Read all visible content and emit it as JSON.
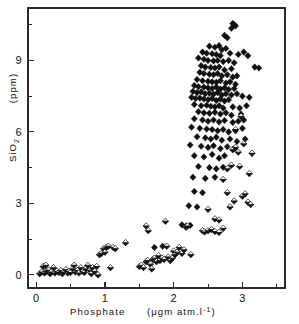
{
  "figure": {
    "background_color": "#ffffff",
    "ink_color": "#111111"
  },
  "chart_data": {
    "type": "scatter",
    "title": "",
    "subtitle": "",
    "xlabel": "Phosphate",
    "xunit": "(μgm atm.l",
    "xunit_sup": "-1",
    "xunit_close": ")",
    "ylabel": "SiO",
    "ylabel_sub": "2",
    "yunit": "(ppm)",
    "xlim": [
      -0.12,
      3.62
    ],
    "ylim": [
      -0.55,
      11.2
    ],
    "xticks": [
      0,
      1,
      2,
      3
    ],
    "xticklabels": [
      "0",
      "1",
      "2",
      "3"
    ],
    "xminorticks": [
      0.5,
      1.5,
      2.5,
      3.5
    ],
    "yticks": [
      0,
      3,
      6,
      9
    ],
    "yticklabels": [
      "0",
      "3",
      "6",
      "9"
    ],
    "yminorticks": [
      1.5,
      4.5,
      7.5,
      10.5
    ],
    "grid": false,
    "legend": null,
    "frame": "box",
    "series": [
      {
        "name": "solid-diamond",
        "marker": "filled-diamond",
        "color": "#101010",
        "points": [
          [
            2.86,
            10.55
          ],
          [
            2.88,
            10.5
          ],
          [
            2.9,
            10.45
          ],
          [
            2.84,
            10.35
          ],
          [
            2.74,
            10.05
          ],
          [
            2.78,
            9.95
          ],
          [
            2.52,
            9.6
          ],
          [
            2.6,
            9.55
          ],
          [
            2.66,
            9.62
          ],
          [
            2.7,
            9.45
          ],
          [
            2.76,
            9.5
          ],
          [
            2.42,
            9.35
          ],
          [
            2.48,
            9.3
          ],
          [
            2.56,
            9.28
          ],
          [
            2.62,
            9.25
          ],
          [
            2.68,
            9.2
          ],
          [
            2.82,
            9.3
          ],
          [
            2.94,
            9.25
          ],
          [
            3.02,
            9.35
          ],
          [
            3.08,
            9.2
          ],
          [
            2.36,
            9.1
          ],
          [
            2.44,
            9.05
          ],
          [
            2.5,
            9.0
          ],
          [
            2.58,
            8.98
          ],
          [
            2.64,
            9.0
          ],
          [
            2.72,
            8.95
          ],
          [
            2.8,
            9.0
          ],
          [
            2.88,
            8.9
          ],
          [
            2.4,
            8.78
          ],
          [
            2.46,
            8.72
          ],
          [
            2.54,
            8.7
          ],
          [
            2.6,
            8.68
          ],
          [
            2.66,
            8.72
          ],
          [
            2.74,
            8.6
          ],
          [
            2.84,
            8.65
          ],
          [
            3.18,
            8.72
          ],
          [
            3.24,
            8.68
          ],
          [
            2.38,
            8.5
          ],
          [
            2.44,
            8.45
          ],
          [
            2.52,
            8.42
          ],
          [
            2.58,
            8.4
          ],
          [
            2.64,
            8.45
          ],
          [
            2.7,
            8.35
          ],
          [
            2.78,
            8.4
          ],
          [
            2.86,
            8.3
          ],
          [
            2.92,
            8.35
          ],
          [
            2.34,
            8.2
          ],
          [
            2.42,
            8.15
          ],
          [
            2.5,
            8.12
          ],
          [
            2.56,
            8.1
          ],
          [
            2.62,
            8.08
          ],
          [
            2.68,
            8.15
          ],
          [
            2.76,
            8.05
          ],
          [
            2.82,
            8.1
          ],
          [
            2.9,
            8.0
          ],
          [
            2.3,
            7.95
          ],
          [
            2.36,
            7.9
          ],
          [
            2.44,
            7.88
          ],
          [
            2.5,
            7.85
          ],
          [
            2.56,
            7.82
          ],
          [
            2.62,
            7.88
          ],
          [
            2.68,
            7.8
          ],
          [
            2.74,
            7.85
          ],
          [
            2.8,
            7.78
          ],
          [
            2.88,
            7.82
          ],
          [
            2.28,
            7.7
          ],
          [
            2.34,
            7.65
          ],
          [
            2.4,
            7.68
          ],
          [
            2.46,
            7.6
          ],
          [
            2.52,
            7.62
          ],
          [
            2.58,
            7.58
          ],
          [
            2.64,
            7.65
          ],
          [
            2.7,
            7.55
          ],
          [
            2.76,
            7.6
          ],
          [
            2.84,
            7.55
          ],
          [
            2.92,
            7.6
          ],
          [
            3.0,
            7.5
          ],
          [
            3.1,
            7.45
          ],
          [
            2.26,
            7.45
          ],
          [
            2.32,
            7.4
          ],
          [
            2.38,
            7.42
          ],
          [
            2.44,
            7.38
          ],
          [
            2.5,
            7.35
          ],
          [
            2.56,
            7.4
          ],
          [
            2.62,
            7.32
          ],
          [
            2.68,
            7.38
          ],
          [
            2.74,
            7.3
          ],
          [
            2.8,
            7.35
          ],
          [
            2.3,
            7.15
          ],
          [
            2.4,
            7.1
          ],
          [
            2.48,
            7.12
          ],
          [
            2.54,
            7.08
          ],
          [
            2.6,
            7.05
          ],
          [
            2.66,
            7.1
          ],
          [
            2.72,
            7.0
          ],
          [
            2.86,
            7.05
          ],
          [
            2.96,
            7.0
          ],
          [
            3.06,
            7.1
          ],
          [
            2.36,
            6.85
          ],
          [
            2.44,
            6.8
          ],
          [
            2.52,
            6.78
          ],
          [
            2.6,
            6.82
          ],
          [
            2.68,
            6.75
          ],
          [
            2.76,
            6.8
          ],
          [
            2.84,
            6.7
          ],
          [
            2.98,
            6.75
          ],
          [
            2.3,
            6.55
          ],
          [
            2.42,
            6.5
          ],
          [
            2.5,
            6.45
          ],
          [
            2.58,
            6.5
          ],
          [
            2.66,
            6.42
          ],
          [
            2.74,
            6.48
          ],
          [
            2.86,
            6.4
          ],
          [
            2.94,
            6.45
          ],
          [
            3.02,
            6.5
          ],
          [
            2.26,
            6.2
          ],
          [
            2.38,
            6.15
          ],
          [
            2.48,
            6.12
          ],
          [
            2.56,
            6.1
          ],
          [
            2.64,
            6.05
          ],
          [
            2.72,
            6.1
          ],
          [
            2.8,
            6.0
          ],
          [
            2.9,
            6.05
          ],
          [
            3.0,
            6.15
          ],
          [
            2.34,
            5.8
          ],
          [
            2.46,
            5.75
          ],
          [
            2.54,
            5.7
          ],
          [
            2.62,
            5.78
          ],
          [
            2.7,
            5.65
          ],
          [
            2.82,
            5.7
          ],
          [
            2.92,
            5.6
          ],
          [
            3.04,
            5.7
          ],
          [
            2.24,
            5.45
          ],
          [
            2.4,
            5.4
          ],
          [
            2.5,
            5.35
          ],
          [
            2.58,
            5.42
          ],
          [
            2.68,
            5.3
          ],
          [
            2.78,
            5.38
          ],
          [
            2.88,
            5.3
          ],
          [
            2.3,
            5.0
          ],
          [
            2.44,
            4.95
          ],
          [
            2.56,
            5.05
          ],
          [
            2.66,
            4.9
          ],
          [
            2.74,
            5.0
          ],
          [
            2.36,
            4.55
          ],
          [
            2.52,
            4.5
          ],
          [
            2.62,
            4.45
          ],
          [
            2.72,
            4.52
          ],
          [
            2.28,
            4.1
          ],
          [
            2.46,
            4.05
          ],
          [
            2.6,
            4.1
          ],
          [
            2.3,
            3.5
          ],
          [
            2.42,
            3.45
          ],
          [
            2.22,
            2.9
          ],
          [
            2.34,
            2.85
          ],
          [
            2.12,
            2.1
          ],
          [
            2.18,
            2.05
          ],
          [
            2.24,
            2.08
          ],
          [
            1.72,
            1.15
          ],
          [
            1.84,
            1.2
          ]
        ]
      },
      {
        "name": "half-filled-diamond",
        "marker": "half-filled-diamond",
        "color": "#101010",
        "points": [
          [
            0.05,
            0.05
          ],
          [
            0.08,
            0.12
          ],
          [
            0.1,
            0.35
          ],
          [
            0.12,
            0.08
          ],
          [
            0.14,
            0.4
          ],
          [
            0.15,
            0.15
          ],
          [
            0.18,
            0.2
          ],
          [
            0.2,
            0.05
          ],
          [
            0.22,
            0.12
          ],
          [
            0.25,
            0.3
          ],
          [
            0.27,
            0.08
          ],
          [
            0.3,
            0.15
          ],
          [
            0.33,
            0.1
          ],
          [
            0.36,
            0.18
          ],
          [
            0.38,
            0.05
          ],
          [
            0.4,
            0.12
          ],
          [
            0.43,
            0.22
          ],
          [
            0.46,
            0.08
          ],
          [
            0.48,
            0.15
          ],
          [
            0.5,
            0.1
          ],
          [
            0.53,
            0.25
          ],
          [
            0.55,
            0.4
          ],
          [
            0.57,
            0.12
          ],
          [
            0.6,
            0.18
          ],
          [
            0.62,
            0.08
          ],
          [
            0.65,
            0.3
          ],
          [
            0.68,
            0.15
          ],
          [
            0.7,
            0.1
          ],
          [
            0.72,
            0.25
          ],
          [
            0.75,
            0.4
          ],
          [
            0.78,
            0.2
          ],
          [
            0.8,
            0.05
          ],
          [
            0.82,
            0.3
          ],
          [
            0.85,
            0.15
          ],
          [
            0.88,
            0.35
          ],
          [
            0.9,
            0.0
          ],
          [
            0.92,
            0.85
          ],
          [
            0.95,
            0.9
          ],
          [
            0.98,
            1.1
          ],
          [
            1.0,
            0.95
          ],
          [
            1.02,
            1.15
          ],
          [
            1.05,
            1.2
          ],
          [
            1.08,
            0.3
          ],
          [
            1.12,
            1.15
          ],
          [
            1.15,
            1.1
          ],
          [
            1.3,
            1.35
          ],
          [
            1.5,
            0.35
          ],
          [
            1.53,
            0.4
          ],
          [
            1.56,
            0.3
          ],
          [
            1.6,
            0.55
          ],
          [
            1.62,
            0.6
          ],
          [
            1.6,
            2.05
          ],
          [
            1.63,
            1.85
          ],
          [
            1.66,
            0.45
          ],
          [
            1.68,
            0.25
          ],
          [
            1.7,
            0.65
          ],
          [
            1.72,
            0.7
          ],
          [
            1.75,
            0.55
          ],
          [
            1.78,
            0.8
          ],
          [
            1.8,
            0.6
          ],
          [
            1.83,
            0.7
          ],
          [
            1.86,
            0.65
          ],
          [
            1.88,
            2.25
          ],
          [
            1.9,
            1.2
          ],
          [
            1.92,
            0.75
          ],
          [
            1.95,
            0.6
          ],
          [
            1.98,
            0.7
          ],
          [
            2.0,
            1.0
          ],
          [
            2.02,
            0.85
          ],
          [
            2.05,
            0.95
          ],
          [
            2.08,
            1.15
          ],
          [
            2.12,
            0.9
          ],
          [
            2.15,
            1.05
          ],
          [
            2.18,
            2.0
          ],
          [
            2.2,
            2.05
          ],
          [
            2.25,
            0.85
          ],
          [
            2.42,
            1.85
          ],
          [
            2.45,
            1.8
          ],
          [
            2.5,
            1.85
          ],
          [
            2.55,
            1.9
          ],
          [
            2.6,
            1.82
          ],
          [
            2.66,
            1.78
          ],
          [
            2.72,
            1.95
          ],
          [
            2.5,
            2.75
          ],
          [
            2.6,
            2.35
          ],
          [
            2.66,
            2.3
          ],
          [
            2.78,
            3.45
          ],
          [
            2.82,
            2.85
          ],
          [
            2.88,
            3.1
          ],
          [
            2.72,
            4.0
          ],
          [
            2.78,
            4.45
          ],
          [
            2.84,
            4.6
          ],
          [
            2.86,
            5.25
          ],
          [
            2.9,
            5.35
          ],
          [
            2.94,
            5.15
          ],
          [
            2.9,
            6.1
          ],
          [
            2.98,
            6.65
          ],
          [
            3.0,
            3.3
          ],
          [
            3.04,
            3.4
          ],
          [
            3.08,
            3.05
          ],
          [
            3.12,
            2.95
          ],
          [
            3.1,
            4.25
          ],
          [
            3.14,
            5.1
          ],
          [
            2.96,
            4.55
          ],
          [
            3.02,
            5.5
          ]
        ]
      }
    ]
  }
}
